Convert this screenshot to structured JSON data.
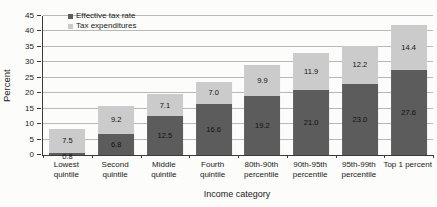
{
  "chart_data": {
    "type": "bar",
    "stacked": true,
    "title": "",
    "xlabel": "Income category",
    "ylabel": "Percent",
    "ylim": [
      0,
      45
    ],
    "ytick_step": 5,
    "grid": true,
    "legend_position": "top-left",
    "value_label_decimals": 1,
    "categories": [
      "Lowest quintile",
      "Second quintile",
      "Middle quintile",
      "Fourth quintile",
      "80th-90th percentile",
      "90th-95th percentile",
      "95th-99th percentile",
      "Top 1 percent"
    ],
    "series": [
      {
        "name": "Effective tax rate",
        "color": "#5c5c5c",
        "values": [
          0.8,
          6.8,
          12.5,
          16.6,
          19.2,
          21.0,
          23.0,
          27.6
        ]
      },
      {
        "name": "Tax expenditures",
        "color": "#cbcbcb",
        "values": [
          7.5,
          9.2,
          7.1,
          7.0,
          9.9,
          11.9,
          12.2,
          14.4
        ]
      }
    ]
  },
  "colors": {
    "grid": "#b8b8b8",
    "axis": "#3a3a3a",
    "text": "#1a1a1a",
    "background": "#fcfcfb"
  }
}
